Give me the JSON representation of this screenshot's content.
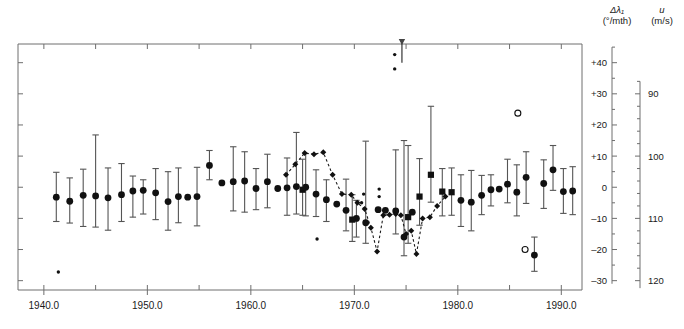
{
  "axes": {
    "left_title_line1": "Δλ₁",
    "left_title_line2": "(°/mth)",
    "right_title_line1": "u",
    "right_title_line2": "(m/s)",
    "left_ticks": [
      "–30",
      "–20",
      "–10",
      "0",
      "+10",
      "+20",
      "+30",
      "+40"
    ],
    "right_ticks": [
      "120",
      "110",
      "100",
      "90"
    ],
    "x_ticks": [
      "1940.0",
      "1950.0",
      "1960.0",
      "1970.0",
      "1980.0",
      "1990.0"
    ]
  },
  "colors": {
    "frame": "#6e6e6e",
    "marker": "#111111",
    "errorbar": "#555555",
    "dotted": "#1a1a1a",
    "text": "#1a1a1a"
  },
  "chart_data": {
    "type": "scatter",
    "title": "",
    "xlabel": "",
    "ylabel": "Δλ₁ (°/mth)",
    "y2label": "u (m/s)",
    "xlim": [
      1937.5,
      1992.0
    ],
    "ylim": [
      46,
      -33
    ],
    "y2lim": [
      87.5,
      121.5
    ],
    "y_ticks": [
      -30,
      -20,
      -10,
      0,
      10,
      20,
      30,
      40
    ],
    "y2_ticks": [
      120,
      110,
      100,
      90
    ],
    "x_ticks": [
      1940,
      1950,
      1960,
      1970,
      1980,
      1990
    ],
    "x_minor_step": 5,
    "grid": false,
    "legend": "none",
    "axis_mapping_note": "Left axis Δλ1 inverted (–30 top, +40 bottom); right axis u: –10 -> 110, +10 -> 100",
    "series": [
      {
        "name": "circle-with-errorbars",
        "marker": "circle",
        "points": [
          {
            "x": 1941.2,
            "y": -3.2,
            "lo": -11.0,
            "hi": 4.8
          },
          {
            "x": 1942.5,
            "y": -4.5,
            "lo": -11.5,
            "hi": 3.0
          },
          {
            "x": 1943.8,
            "y": -2.6,
            "lo": -12.6,
            "hi": 5.8
          },
          {
            "x": 1945.0,
            "y": -2.8,
            "lo": -12.8,
            "hi": 16.8
          },
          {
            "x": 1946.2,
            "y": -3.4,
            "lo": -13.8,
            "hi": 6.2
          },
          {
            "x": 1947.5,
            "y": -2.4,
            "lo": -11.0,
            "hi": 7.6
          },
          {
            "x": 1948.6,
            "y": -1.2,
            "lo": -9.6,
            "hi": 3.6
          },
          {
            "x": 1949.6,
            "y": -1.0,
            "lo": -8.6,
            "hi": 2.4
          },
          {
            "x": 1950.8,
            "y": -1.8,
            "lo": -10.4,
            "hi": 6.0
          },
          {
            "x": 1952.0,
            "y": -4.6,
            "lo": -13.8,
            "hi": 5.0
          },
          {
            "x": 1953.0,
            "y": -3.0,
            "lo": -11.4,
            "hi": 6.2
          },
          {
            "x": 1953.9,
            "y": -3.2,
            "lo": -3.2,
            "hi": -3.2
          },
          {
            "x": 1954.8,
            "y": -3.0,
            "lo": -12.4,
            "hi": 6.4
          },
          {
            "x": 1956.0,
            "y": 7.0,
            "lo": 2.4,
            "hi": 11.8
          },
          {
            "x": 1957.2,
            "y": 1.4,
            "lo": 1.4,
            "hi": 1.4
          },
          {
            "x": 1958.3,
            "y": 1.8,
            "lo": -7.6,
            "hi": 13.0
          },
          {
            "x": 1959.4,
            "y": 2.0,
            "lo": -8.0,
            "hi": 11.4
          },
          {
            "x": 1960.5,
            "y": -0.4,
            "lo": -7.2,
            "hi": 6.0
          },
          {
            "x": 1961.6,
            "y": 1.8,
            "lo": -6.6,
            "hi": 10.6
          },
          {
            "x": 1962.6,
            "y": -0.4,
            "lo": -0.4,
            "hi": -0.4
          },
          {
            "x": 1963.5,
            "y": -0.2,
            "lo": -9.0,
            "hi": 9.4
          },
          {
            "x": 1964.4,
            "y": 0.2,
            "lo": -8.6,
            "hi": 17.6
          },
          {
            "x": 1965.3,
            "y": 0.0,
            "lo": -9.2,
            "hi": 10.8
          },
          {
            "x": 1966.3,
            "y": -2.2,
            "lo": -9.4,
            "hi": 5.6
          },
          {
            "x": 1967.3,
            "y": -4.0,
            "lo": -11.0,
            "hi": 2.4
          },
          {
            "x": 1968.3,
            "y": -5.4,
            "lo": -5.4,
            "hi": -5.4
          },
          {
            "x": 1969.2,
            "y": -7.4,
            "lo": -14.0,
            "hi": 2.6
          },
          {
            "x": 1970.2,
            "y": -10.0,
            "lo": -16.0,
            "hi": -4.2
          },
          {
            "x": 1971.1,
            "y": -11.4,
            "lo": -18.0,
            "hi": 14.8
          },
          {
            "x": 1972.3,
            "y": -7.2,
            "lo": -7.2,
            "hi": -7.2
          },
          {
            "x": 1973.0,
            "y": -7.4,
            "lo": -7.4,
            "hi": -7.4
          },
          {
            "x": 1974.0,
            "y": -7.6,
            "lo": -15.0,
            "hi": 12.0
          },
          {
            "x": 1974.8,
            "y": -16.0,
            "lo": -22.0,
            "hi": 15.0
          },
          {
            "x": 1975.6,
            "y": -8.0,
            "lo": -8.0,
            "hi": -8.0
          },
          {
            "x": 1980.3,
            "y": -4.2,
            "lo": -12.6,
            "hi": 4.0
          },
          {
            "x": 1981.3,
            "y": -4.8,
            "lo": -14.0,
            "hi": 5.4
          },
          {
            "x": 1982.3,
            "y": -2.6,
            "lo": -8.8,
            "hi": 3.8
          },
          {
            "x": 1983.2,
            "y": -0.8,
            "lo": -6.0,
            "hi": 4.0
          },
          {
            "x": 1984.0,
            "y": -0.6,
            "lo": -0.6,
            "hi": -0.6
          },
          {
            "x": 1984.8,
            "y": 1.0,
            "lo": -5.0,
            "hi": 9.0
          },
          {
            "x": 1985.7,
            "y": -1.6,
            "lo": -9.2,
            "hi": 7.2
          },
          {
            "x": 1986.6,
            "y": 3.2,
            "lo": -5.2,
            "hi": 11.4
          },
          {
            "x": 1987.4,
            "y": -21.8,
            "lo": -27.0,
            "hi": -16.0
          },
          {
            "x": 1988.3,
            "y": 1.2,
            "lo": -6.8,
            "hi": 8.8
          },
          {
            "x": 1989.2,
            "y": 5.6,
            "lo": -1.0,
            "hi": 13.4
          },
          {
            "x": 1990.2,
            "y": -1.4,
            "lo": -8.4,
            "hi": 6.0
          },
          {
            "x": 1991.1,
            "y": -1.2,
            "lo": -8.8,
            "hi": 6.6
          }
        ]
      },
      {
        "name": "square-with-errorbars",
        "marker": "square",
        "points": [
          {
            "x": 1965.0,
            "y": -0.8,
            "lo": -9.0,
            "hi": 9.0
          },
          {
            "x": 1969.8,
            "y": -10.4,
            "lo": -17.4,
            "hi": -2.4
          },
          {
            "x": 1975.2,
            "y": -9.6,
            "lo": -18.0,
            "hi": 13.4
          },
          {
            "x": 1976.3,
            "y": -3.0,
            "lo": -12.2,
            "hi": 9.2
          },
          {
            "x": 1977.4,
            "y": 4.0,
            "lo": -4.8,
            "hi": 26.0
          },
          {
            "x": 1978.5,
            "y": -1.4,
            "lo": -9.2,
            "hi": 6.0
          },
          {
            "x": 1979.4,
            "y": -1.6,
            "lo": -9.0,
            "hi": 6.2
          }
        ]
      },
      {
        "name": "dotted-curve-diamonds",
        "marker": "diamond",
        "linestyle": "dotted",
        "points": [
          {
            "x": 1963.4,
            "y": 4.0
          },
          {
            "x": 1964.3,
            "y": 7.4
          },
          {
            "x": 1965.2,
            "y": 11.0
          },
          {
            "x": 1966.1,
            "y": 10.6
          },
          {
            "x": 1967.0,
            "y": 11.2
          },
          {
            "x": 1967.9,
            "y": 4.0
          },
          {
            "x": 1968.8,
            "y": -2.2
          },
          {
            "x": 1969.7,
            "y": -2.4
          },
          {
            "x": 1970.3,
            "y": -5.0
          },
          {
            "x": 1971.0,
            "y": -7.0
          },
          {
            "x": 1971.6,
            "y": -13.0
          },
          {
            "x": 1972.2,
            "y": -20.6
          },
          {
            "x": 1972.8,
            "y": -9.0
          },
          {
            "x": 1973.4,
            "y": -8.8
          },
          {
            "x": 1974.0,
            "y": -8.6
          },
          {
            "x": 1974.5,
            "y": -9.0
          },
          {
            "x": 1975.0,
            "y": -15.0
          },
          {
            "x": 1975.5,
            "y": -14.0
          },
          {
            "x": 1976.0,
            "y": -21.4
          },
          {
            "x": 1976.6,
            "y": -10.0
          },
          {
            "x": 1977.3,
            "y": -9.6
          },
          {
            "x": 1978.0,
            "y": -6.0
          },
          {
            "x": 1978.8,
            "y": -3.0
          }
        ]
      },
      {
        "name": "open-circle-outliers",
        "marker": "open-circle",
        "points": [
          {
            "x": 1986.5,
            "y": -20.0
          },
          {
            "x": 1985.8,
            "y": 23.8
          }
        ]
      },
      {
        "name": "small-dot-outliers",
        "marker": "small-dot",
        "points": [
          {
            "x": 1941.4,
            "y": -27.2
          },
          {
            "x": 1966.4,
            "y": -16.6
          },
          {
            "x": 1970.7,
            "y": -5.0
          },
          {
            "x": 1970.9,
            "y": -2.2
          },
          {
            "x": 1972.4,
            "y": -3.0
          },
          {
            "x": 1972.4,
            "y": -0.6
          },
          {
            "x": 1973.9,
            "y": 38.0
          },
          {
            "x": 1973.9,
            "y": 42.6
          }
        ]
      }
    ],
    "annotations": [
      {
        "type": "arrow",
        "x": 1974.6,
        "y_from": 40.0,
        "y_to": 46.0,
        "direction": "down"
      }
    ]
  }
}
